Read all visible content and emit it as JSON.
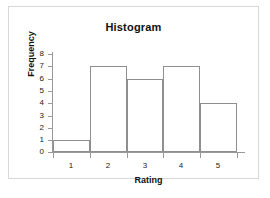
{
  "chart_data": {
    "type": "bar",
    "title": "Histogram",
    "xlabel": "Rating",
    "ylabel": "Frequency",
    "categories": [
      "1",
      "2",
      "3",
      "4",
      "5"
    ],
    "values": [
      1,
      7,
      6,
      7,
      4
    ],
    "ylim": [
      0,
      8
    ],
    "yticks": [
      "0",
      "1",
      "2",
      "3",
      "4",
      "5",
      "6",
      "7",
      "8"
    ],
    "grid": false,
    "legend": false,
    "bar_fill_color": "#ffffff",
    "bar_edge_color": "#8f8f8f",
    "axis_color": "#9a9a9a",
    "frame_color": "#d8d8d8",
    "background_color": "#ffffff",
    "text_color": "#111111"
  }
}
